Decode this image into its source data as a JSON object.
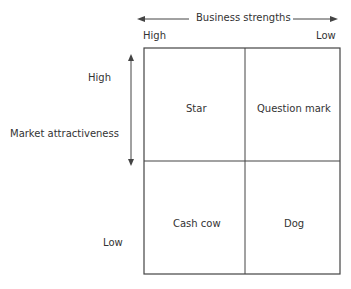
{
  "x_axis": {
    "label": "Business strengths",
    "left_label": "High",
    "right_label": "Low"
  },
  "y_axis": {
    "label": "Market attractiveness",
    "top_label": "High",
    "bottom_label": "Low"
  },
  "quadrants": {
    "top_left": "Star",
    "top_right": "Question mark",
    "bottom_left": "Cash cow",
    "bottom_right": "Dog"
  },
  "colors": {
    "line": "#444444",
    "text": "#333333",
    "background": "#ffffff"
  }
}
